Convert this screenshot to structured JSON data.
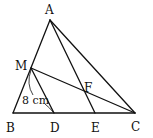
{
  "diagram": {
    "type": "geometry",
    "points": {
      "A": {
        "label": "A",
        "x": 50,
        "y": 20,
        "lx": 50,
        "ly": 14
      },
      "B": {
        "label": "B",
        "x": 13,
        "y": 113,
        "lx": 11,
        "ly": 132
      },
      "C": {
        "label": "C",
        "x": 135,
        "y": 113,
        "lx": 137,
        "ly": 131
      },
      "D": {
        "label": "D",
        "x": 54,
        "y": 113,
        "lx": 56,
        "ly": 132
      },
      "E": {
        "label": "E",
        "x": 95,
        "y": 113,
        "lx": 96,
        "ly": 132
      },
      "M": {
        "label": "M",
        "x": 31,
        "y": 68,
        "lx": 21,
        "ly": 71
      },
      "F": {
        "label": "F",
        "x": 83,
        "y": 90,
        "lx": 88,
        "ly": 90
      }
    },
    "segments": [
      [
        "A",
        "B"
      ],
      [
        "A",
        "C"
      ],
      [
        "B",
        "C"
      ],
      [
        "A",
        "E"
      ],
      [
        "M",
        "C"
      ],
      [
        "M",
        "D"
      ]
    ],
    "measurement": {
      "segment": [
        "M",
        "D"
      ],
      "label": "8 cm"
    }
  }
}
